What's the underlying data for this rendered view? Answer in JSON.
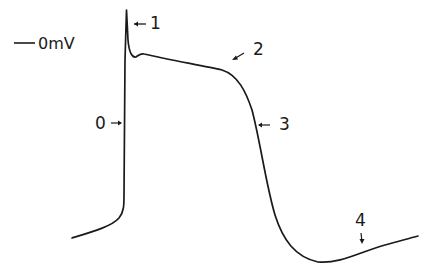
{
  "figure": {
    "type": "cardiac ventricular action potential (hand-drawn)",
    "reference_label": "0mV",
    "phases": [
      {
        "id": "0",
        "label": "0"
      },
      {
        "id": "1",
        "label": "1"
      },
      {
        "id": "2",
        "label": "2"
      },
      {
        "id": "3",
        "label": "3"
      },
      {
        "id": "4",
        "label": "4"
      }
    ],
    "caption": "",
    "colors": {
      "stroke": "#1a1a1a",
      "background": "#ffffff"
    }
  }
}
